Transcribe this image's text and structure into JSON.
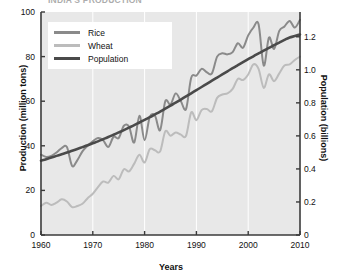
{
  "figure": {
    "title_clipped": "INDIA'S PRODUCTION",
    "background": "#ffffff",
    "plot_background": "#e8e8e8",
    "gridline_color": "#ffffff",
    "axis_color": "#3a3a3a"
  },
  "legend": {
    "position": "upper-left-inside",
    "background": "#ffffff",
    "entries": [
      {
        "label": "Rice",
        "color": "#8a8a8a"
      },
      {
        "label": "Wheat",
        "color": "#bcbcbc"
      },
      {
        "label": "Population",
        "color": "#4a4a4a"
      }
    ]
  },
  "axes": {
    "x": {
      "label": "Years",
      "ticks": [
        "1960",
        "1970",
        "1980",
        "1990",
        "2000",
        "2010"
      ],
      "min": 1960,
      "max": 2010
    },
    "y_left": {
      "label": "Production (million tons)",
      "ticks": [
        "0",
        "20",
        "40",
        "60",
        "80",
        "100"
      ],
      "min": 0,
      "max": 100
    },
    "y_right": {
      "label": "Population (billions)",
      "ticks": [
        "0",
        "0.2",
        "0.4",
        "0.6",
        "0.8",
        "1.0",
        "1.2"
      ],
      "min": 0,
      "max": 1.35
    }
  },
  "chart_data": {
    "type": "line",
    "title": "INDIA'S PRODUCTION",
    "xlabel": "Years",
    "ylabel": "Production (million tons)",
    "ylabel_secondary": "Population (billions)",
    "xlim": [
      1960,
      2010
    ],
    "ylim": [
      0,
      100
    ],
    "ylim_secondary": [
      0,
      1.35
    ],
    "grid": "vertical-only",
    "legend_position": "upper left",
    "x": [
      1960,
      1961,
      1962,
      1963,
      1964,
      1965,
      1966,
      1967,
      1968,
      1969,
      1970,
      1971,
      1972,
      1973,
      1974,
      1975,
      1976,
      1977,
      1978,
      1979,
      1980,
      1981,
      1982,
      1983,
      1984,
      1985,
      1986,
      1987,
      1988,
      1989,
      1990,
      1991,
      1992,
      1993,
      1994,
      1995,
      1996,
      1997,
      1998,
      1999,
      2000,
      2001,
      2002,
      2003,
      2004,
      2005,
      2006,
      2007,
      2008,
      2009,
      2010
    ],
    "series": [
      {
        "name": "Rice",
        "color": "#8a8a8a",
        "axis": "left",
        "units": "million tons",
        "values": [
          36.0,
          35.0,
          35.5,
          37.0,
          39.0,
          39.5,
          31.0,
          33.5,
          37.5,
          40.0,
          42.0,
          43.5,
          42.5,
          39.5,
          44.0,
          43.5,
          49.0,
          48.5,
          41.5,
          53.5,
          42.5,
          53.0,
          53.5,
          47.0,
          60.0,
          58.5,
          63.5,
          60.0,
          56.5,
          70.5,
          71.5,
          74.5,
          73.0,
          72.5,
          80.0,
          81.5,
          81.0,
          82.0,
          86.0,
          84.0,
          89.5,
          93.0,
          94.5,
          76.0,
          88.5,
          83.5,
          91.5,
          93.5,
          96.0,
          93.0,
          96.5
        ]
      },
      {
        "name": "Wheat",
        "color": "#bcbcbc",
        "axis": "left",
        "units": "million tons",
        "values": [
          13.0,
          14.5,
          13.5,
          14.5,
          16.0,
          15.0,
          12.5,
          13.0,
          14.0,
          16.5,
          18.5,
          21.5,
          24.0,
          23.5,
          26.5,
          25.0,
          29.5,
          28.5,
          32.0,
          36.0,
          32.5,
          38.5,
          38.0,
          37.5,
          46.5,
          44.5,
          46.0,
          45.0,
          44.5,
          55.0,
          51.5,
          56.0,
          56.5,
          55.5,
          61.5,
          63.0,
          63.5,
          65.5,
          70.0,
          69.5,
          72.0,
          76.5,
          74.5,
          66.0,
          72.0,
          69.0,
          72.5,
          76.0,
          76.5,
          78.5,
          80.0
        ]
      },
      {
        "name": "Population",
        "color": "#4a4a4a",
        "axis": "right",
        "units": "billions",
        "values": [
          0.45,
          0.459,
          0.469,
          0.479,
          0.489,
          0.499,
          0.51,
          0.521,
          0.532,
          0.543,
          0.555,
          0.567,
          0.58,
          0.593,
          0.607,
          0.621,
          0.635,
          0.65,
          0.665,
          0.681,
          0.697,
          0.713,
          0.73,
          0.747,
          0.765,
          0.783,
          0.801,
          0.82,
          0.839,
          0.858,
          0.877,
          0.896,
          0.915,
          0.934,
          0.953,
          0.972,
          0.991,
          1.01,
          1.028,
          1.046,
          1.064,
          1.082,
          1.099,
          1.116,
          1.133,
          1.149,
          1.165,
          1.181,
          1.196,
          1.204,
          1.214
        ]
      }
    ]
  }
}
